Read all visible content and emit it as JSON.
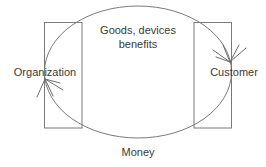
{
  "diagram": {
    "background_color": "#ffffff",
    "line_color": "#7a7a7a",
    "text_color": "#3a3a3a",
    "nodes": [
      {
        "id": "organization",
        "label": "Organization",
        "shape": "rectangle",
        "x": 44,
        "y": 22,
        "width": 38,
        "height": 106,
        "label_x": 45,
        "label_y": 76
      },
      {
        "id": "customer",
        "label": "Customer",
        "shape": "rectangle",
        "x": 194,
        "y": 22,
        "width": 38,
        "height": 106,
        "label_x": 234,
        "label_y": 76
      }
    ],
    "cycle": {
      "shape": "ellipse",
      "cx": 138,
      "cy": 72,
      "rx": 94,
      "ry": 66
    },
    "flow_labels": {
      "top_line_1": "Goods, devices",
      "top_line_2": "benefits",
      "top_x": 138,
      "top_line_1_y": 34,
      "top_line_2_y": 48,
      "bottom": "Money",
      "bottom_x": 138,
      "bottom_y": 156
    },
    "arrowheads": [
      {
        "id": "arrow-to-organization",
        "target": "organization",
        "tip_x": 45,
        "tip_y": 79,
        "direction": "down-left"
      },
      {
        "id": "arrow-to-customer",
        "target": "customer",
        "tip_x": 230,
        "tip_y": 62,
        "direction": "up-right"
      }
    ]
  }
}
